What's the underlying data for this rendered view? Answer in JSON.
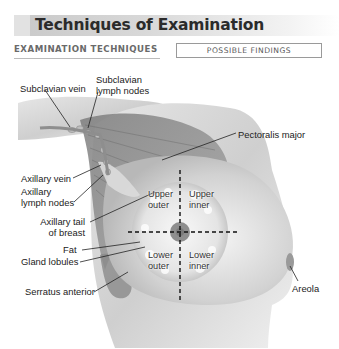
{
  "header": {
    "title": "Techniques of Examination"
  },
  "columns": {
    "left_heading": "EXAMINATION TECHNIQUES",
    "right_heading": "POSSIBLE FINDINGS"
  },
  "figure": {
    "labels": {
      "subclavian_vein": "Subclavian vein",
      "subclavian_lymph_nodes_1": "Subclavian",
      "subclavian_lymph_nodes_2": "lymph nodes",
      "pectoralis_major": "Pectoralis major",
      "axillary_vein": "Axillary vein",
      "axillary_lymph_nodes_1": "Axillary",
      "axillary_lymph_nodes_2": "lymph nodes",
      "axillary_tail_1": "Axillary tail",
      "axillary_tail_2": "of breast",
      "fat": "Fat",
      "gland_lobules": "Gland lobules",
      "serratus_anterior": "Serratus anterior",
      "areola": "Areola"
    },
    "quadrants": {
      "upper_outer_1": "Upper",
      "upper_outer_2": "outer",
      "upper_inner_1": "Upper",
      "upper_inner_2": "inner",
      "lower_outer_1": "Lower",
      "lower_outer_2": "outer",
      "lower_inner_1": "Lower",
      "lower_inner_2": "inner"
    }
  }
}
